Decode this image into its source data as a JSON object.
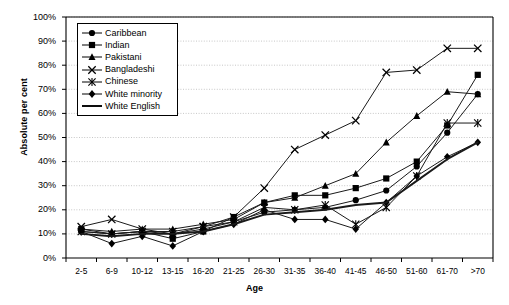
{
  "chart_data": {
    "type": "line",
    "title": "",
    "xlabel": "Age",
    "ylabel": "Absolute per cent",
    "ylim": [
      0,
      100
    ],
    "ytick_labels": [
      "0%",
      "10%",
      "20%",
      "30%",
      "40%",
      "50%",
      "60%",
      "70%",
      "80%",
      "90%",
      "100%"
    ],
    "ytick_values": [
      0,
      10,
      20,
      30,
      40,
      50,
      60,
      70,
      80,
      90,
      100
    ],
    "grid": "horizontal",
    "legend_position": "top-left-inside",
    "categories": [
      "2-5",
      "6-9",
      "10-12",
      "13-15",
      "16-20",
      "21-25",
      "26-30",
      "31-35",
      "36-40",
      "41-45",
      "46-50",
      "51-60",
      "61-70",
      ">70"
    ],
    "series": [
      {
        "name": "Caribbean",
        "marker": "circle",
        "values": [
          11,
          10,
          11,
          10,
          12,
          15,
          19,
          20,
          21,
          24,
          28,
          38,
          52,
          68
        ]
      },
      {
        "name": "Indian",
        "marker": "square",
        "values": [
          12,
          10,
          11,
          8,
          11,
          17,
          23,
          26,
          26,
          29,
          33,
          40,
          55,
          76
        ]
      },
      {
        "name": "Pakistani",
        "marker": "triangle",
        "values": [
          12,
          11,
          12,
          12,
          14,
          16,
          23,
          25,
          30,
          35,
          48,
          59,
          69,
          68
        ]
      },
      {
        "name": "Bangladeshi",
        "marker": "cross",
        "values": [
          13,
          16,
          12,
          10,
          13,
          17,
          29,
          45,
          51,
          57,
          77,
          78,
          87,
          87
        ]
      },
      {
        "name": "Chinese",
        "marker": "asterisk",
        "values": [
          11,
          10,
          11,
          11,
          13,
          15,
          21,
          20,
          22,
          14,
          21,
          34,
          56,
          56
        ]
      },
      {
        "name": "White minority",
        "marker": "diamond",
        "values": [
          11,
          6,
          9,
          5,
          11,
          14,
          20,
          16,
          16,
          12,
          23,
          34,
          42,
          48
        ]
      },
      {
        "name": "White English",
        "marker": "none",
        "values": [
          10,
          9,
          10,
          10,
          11,
          14,
          18,
          19,
          20,
          22,
          23,
          32,
          41,
          48
        ]
      }
    ]
  },
  "legend": {
    "entries": [
      {
        "label": "Caribbean",
        "marker": "circle"
      },
      {
        "label": "Indian",
        "marker": "square"
      },
      {
        "label": "Pakistani",
        "marker": "triangle"
      },
      {
        "label": "Bangladeshi",
        "marker": "cross"
      },
      {
        "label": "Chinese",
        "marker": "asterisk"
      },
      {
        "label": "White minority",
        "marker": "diamond"
      },
      {
        "label": "White English",
        "marker": "none"
      }
    ]
  }
}
